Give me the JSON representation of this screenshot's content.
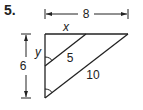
{
  "problem": {
    "number": "5."
  },
  "diagram": {
    "dimensions": {
      "width_label": "8",
      "height_label": "6"
    },
    "segments": {
      "top_inner": "x",
      "left_upper": "y",
      "inner_hyp": "5",
      "outer_hyp": "10"
    }
  }
}
